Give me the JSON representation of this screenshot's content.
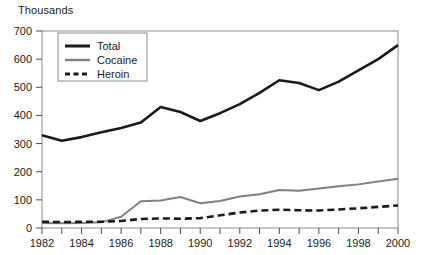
{
  "chart_data": {
    "type": "line",
    "title": "",
    "subtitle": "",
    "unit_label": "Thousands",
    "xlabel": "",
    "ylabel": "",
    "xlim": [
      1982,
      2000
    ],
    "ylim": [
      0,
      700
    ],
    "grid": false,
    "legend_position": "top-left-inside",
    "x": [
      1982,
      1983,
      1984,
      1985,
      1986,
      1987,
      1988,
      1989,
      1990,
      1991,
      1992,
      1993,
      1994,
      1995,
      1996,
      1997,
      1998,
      1999,
      2000
    ],
    "y_ticks": [
      0,
      100,
      200,
      300,
      400,
      500,
      600,
      700
    ],
    "y_tick_labels": [
      "0",
      "100",
      "200",
      "300",
      "400",
      "500",
      "600",
      "700"
    ],
    "x_ticks": [
      1982,
      1983,
      1984,
      1985,
      1986,
      1987,
      1988,
      1989,
      1990,
      1991,
      1992,
      1993,
      1994,
      1995,
      1996,
      1997,
      1998,
      1999,
      2000
    ],
    "x_tick_labels": [
      "1982",
      "",
      "1984",
      "",
      "1986",
      "",
      "1988",
      "",
      "1990",
      "",
      "1992",
      "",
      "1994",
      "",
      "1996",
      "",
      "1998",
      "",
      "2000"
    ],
    "x_labeled_ticks": [
      "1982",
      "1984",
      "1986",
      "1988",
      "1990",
      "1992",
      "1994",
      "1996",
      "1998",
      "2000"
    ],
    "series": [
      {
        "name": "Total",
        "color": "#1a1a1a",
        "style": "solid",
        "width": 2.6,
        "values": [
          330,
          310,
          323,
          340,
          355,
          375,
          430,
          412,
          380,
          408,
          440,
          480,
          525,
          515,
          490,
          520,
          560,
          600,
          650
        ]
      },
      {
        "name": "Cocaine",
        "color": "#808080",
        "style": "solid",
        "width": 2.0,
        "values": [
          18,
          17,
          18,
          20,
          40,
          95,
          98,
          110,
          88,
          96,
          112,
          120,
          135,
          132,
          140,
          148,
          155,
          165,
          175
        ]
      },
      {
        "name": "Heroin",
        "color": "#1a1a1a",
        "style": "dashed",
        "width": 2.6,
        "values": [
          22,
          21,
          22,
          22,
          25,
          32,
          34,
          33,
          35,
          45,
          55,
          62,
          65,
          63,
          62,
          66,
          70,
          75,
          80
        ]
      }
    ]
  },
  "legend": {
    "items": [
      {
        "label": "Total"
      },
      {
        "label": "Cocaine"
      },
      {
        "label": "Heroin"
      }
    ]
  },
  "colors": {
    "total": "#1a1a1a",
    "cocaine": "#808080",
    "heroin": "#1a1a1a",
    "axis": "#4d4d4d",
    "frame": "#8c8c8c",
    "text": "#1a1a1a",
    "background": "#ffffff"
  }
}
